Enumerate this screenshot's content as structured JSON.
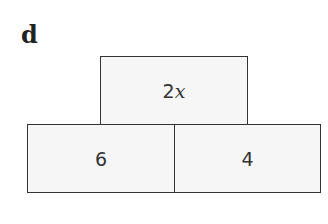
{
  "label": "d",
  "pyramid": {
    "top": {
      "coef": "2",
      "var": "x"
    },
    "bottom_left": "6",
    "bottom_right": "4"
  }
}
